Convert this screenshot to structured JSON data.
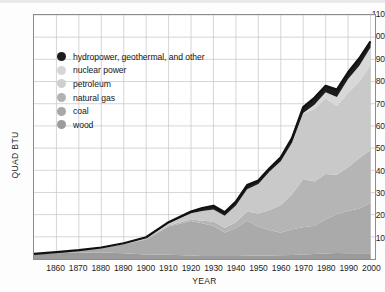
{
  "chart_data": {
    "type": "area",
    "title": "",
    "xlabel": "YEAR",
    "ylabel": "QUAD BTU",
    "xlim": [
      1850,
      2002
    ],
    "ylim": [
      0,
      110
    ],
    "yticks": [
      10,
      20,
      30,
      40,
      50,
      60,
      70,
      80,
      90,
      100,
      110
    ],
    "xticks": [
      1860,
      1870,
      1880,
      1890,
      1900,
      1910,
      1920,
      1930,
      1940,
      1950,
      1960,
      1970,
      1980,
      1990,
      2000
    ],
    "grid": true,
    "legend_position": "upper-left-inside",
    "stacking": "stacked",
    "stack_order_bottom_to_top": [
      "wood",
      "coal",
      "natural gas",
      "petroleum",
      "nuclear power",
      "hydropower, geothermal, and other"
    ],
    "x": [
      1850,
      1860,
      1870,
      1880,
      1890,
      1900,
      1910,
      1920,
      1925,
      1930,
      1935,
      1940,
      1945,
      1950,
      1955,
      1960,
      1965,
      1970,
      1975,
      1980,
      1985,
      1990,
      1995,
      2000
    ],
    "series": [
      {
        "name": "wood",
        "color": "#9a9a9a",
        "values": [
          2.1,
          2.6,
          2.9,
          2.9,
          2.6,
          2.0,
          1.9,
          1.6,
          1.4,
          1.3,
          1.3,
          1.4,
          1.5,
          1.6,
          1.6,
          1.7,
          1.8,
          2.0,
          2.2,
          2.5,
          2.7,
          2.6,
          2.6,
          2.6
        ]
      },
      {
        "name": "coal",
        "color": "#aaaaaa",
        "values": [
          0.2,
          0.5,
          1.0,
          2.1,
          4.1,
          6.8,
          12.7,
          15.5,
          14.7,
          13.6,
          10.6,
          12.5,
          15.9,
          12.9,
          11.5,
          10.1,
          11.6,
          12.3,
          12.8,
          15.4,
          17.5,
          19.2,
          20.1,
          22.6
        ]
      },
      {
        "name": "natural gas",
        "color": "#b5b5b5",
        "values": [
          0.0,
          0.0,
          0.0,
          0.0,
          0.1,
          0.3,
          0.5,
          0.8,
          1.2,
          2.0,
          2.2,
          2.7,
          4.0,
          6.0,
          9.0,
          12.4,
          15.8,
          21.8,
          19.9,
          20.4,
          17.8,
          19.6,
          22.7,
          23.9
        ]
      },
      {
        "name": "petroleum",
        "color": "#c9c9c9",
        "values": [
          0.0,
          0.0,
          0.1,
          0.2,
          0.2,
          0.4,
          1.0,
          2.7,
          4.3,
          5.4,
          5.4,
          7.5,
          10.1,
          13.3,
          17.3,
          19.9,
          23.2,
          29.5,
          32.7,
          34.2,
          30.9,
          33.6,
          34.6,
          38.3
        ]
      },
      {
        "name": "nuclear power",
        "color": "#d8d8d8",
        "values": [
          0.0,
          0.0,
          0.0,
          0.0,
          0.0,
          0.0,
          0.0,
          0.0,
          0.0,
          0.0,
          0.0,
          0.0,
          0.0,
          0.0,
          0.0,
          0.0,
          0.0,
          0.2,
          1.9,
          2.7,
          4.1,
          6.1,
          7.1,
          7.9
        ]
      },
      {
        "name": "hydropower, geothermal, and other",
        "color": "#1c1c1c",
        "values": [
          0.0,
          0.0,
          0.0,
          0.0,
          0.1,
          0.3,
          0.5,
          0.8,
          1.4,
          1.7,
          1.6,
          1.8,
          1.8,
          1.6,
          1.5,
          1.7,
          2.1,
          2.7,
          3.2,
          2.9,
          3.4,
          3.1,
          3.4,
          2.8
        ]
      }
    ],
    "totals": [
      2.3,
      3.1,
      4.0,
      5.2,
      7.1,
      9.8,
      16.6,
      21.4,
      23.0,
      24.0,
      21.1,
      25.9,
      33.3,
      35.4,
      40.9,
      45.8,
      54.5,
      68.5,
      72.7,
      78.1,
      76.4,
      84.2,
      90.5,
      98.1
    ]
  },
  "axes": {
    "y_label": "QUAD BTU",
    "x_label": "YEAR",
    "y_ticks": [
      "10",
      "20",
      "30",
      "40",
      "50",
      "60",
      "70",
      "80",
      "90",
      "100",
      "110"
    ],
    "x_ticks": [
      "1860",
      "1870",
      "1880",
      "1890",
      "1900",
      "1910",
      "1920",
      "1930",
      "1940",
      "1950",
      "1960",
      "1970",
      "1980",
      "1990",
      "2000"
    ]
  },
  "legend": {
    "items": [
      {
        "label": "hydropower, geothermal, and other",
        "color": "#1c1c1c"
      },
      {
        "label": "nuclear power",
        "color": "#d6d6d6"
      },
      {
        "label": "petroleum",
        "color": "#cfcfcf"
      },
      {
        "label": "natural gas",
        "color": "#b2b2b2"
      },
      {
        "label": "coal",
        "color": "#a8a8a8"
      },
      {
        "label": "wood",
        "color": "#9b9b9b"
      }
    ]
  },
  "colors": {
    "frame": "#8c8c8c",
    "grid": "#c4c4c4",
    "background": "#ffffff",
    "text": "#1a1a1a"
  }
}
